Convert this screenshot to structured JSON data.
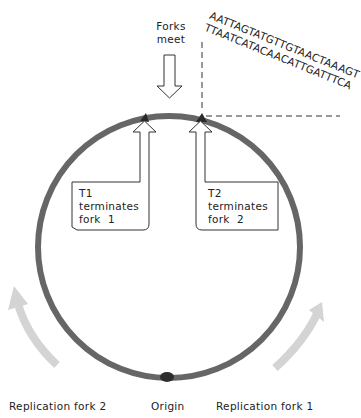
{
  "labels": {
    "forks_meet": [
      "Forks",
      "meet"
    ],
    "t1": [
      "T1",
      "terminates",
      "fork  1"
    ],
    "t2": [
      "T2",
      "terminates",
      "fork  2"
    ],
    "replication_fork_2": "Replication fork 2",
    "origin": "Origin",
    "replication_fork_1": "Replication fork 1"
  },
  "sequence": {
    "top_strand": "AATTAGTATGTTGTAACTAAAGT",
    "bottom_strand": "TTAATCATACAACATTGATTTCA"
  },
  "colors": {
    "chromosome": "#666666",
    "fork_arrows": "#d4d4d4",
    "outline": "#333333",
    "marker": "#2a2a2a"
  }
}
